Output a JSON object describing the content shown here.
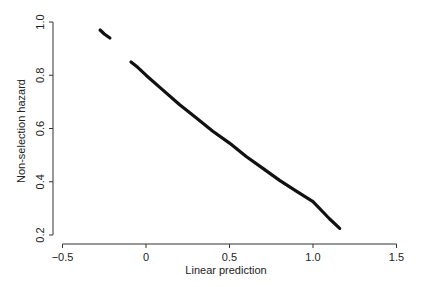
{
  "chart_data": {
    "type": "scatter",
    "title": "",
    "xlabel": "Linear prediction",
    "ylabel": "Non-selection hazard",
    "xlim": [
      -0.55,
      1.55
    ],
    "ylim": [
      0.18,
      1.02
    ],
    "x_ticks": [
      -0.5,
      0,
      0.5,
      1.0,
      1.5
    ],
    "x_tick_labels": [
      "−0.5",
      "0",
      "0.5",
      "1.0",
      "1.5"
    ],
    "y_ticks": [
      0.2,
      0.4,
      0.6,
      0.8,
      1.0
    ],
    "y_tick_labels": [
      "0.2",
      "0.4",
      "0.6",
      "0.8",
      "1.0"
    ],
    "grid": false,
    "legend": null,
    "series": [
      {
        "name": "segment-1",
        "x": [
          -0.275,
          -0.25,
          -0.216
        ],
        "y": [
          0.97,
          0.955,
          0.94
        ]
      },
      {
        "name": "segment-2",
        "x": [
          -0.09,
          -0.05,
          0.0,
          0.1,
          0.2,
          0.3,
          0.4,
          0.5,
          0.6,
          0.7,
          0.8,
          0.9,
          1.0,
          1.1,
          1.16
        ],
        "y": [
          0.85,
          0.83,
          0.8,
          0.745,
          0.69,
          0.64,
          0.59,
          0.545,
          0.495,
          0.45,
          0.405,
          0.365,
          0.325,
          0.26,
          0.225
        ]
      }
    ],
    "plot_area": {
      "left": 53,
      "right": 405,
      "top": 18,
      "bottom": 244
    },
    "x_pixel_map": {
      "v0": 0,
      "p0": 146,
      "v1": 1.0,
      "p1": 313
    },
    "y_pixel_map": {
      "v0": 1.0,
      "p0": 22,
      "v1": 0.2,
      "p1": 235
    }
  }
}
